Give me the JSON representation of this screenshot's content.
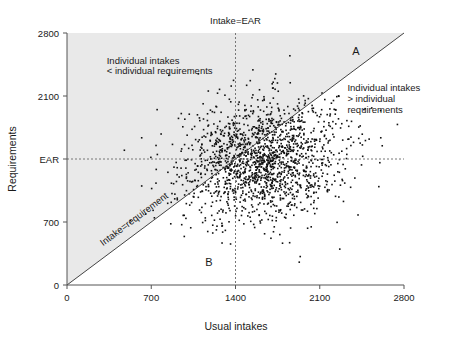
{
  "chart_data": {
    "type": "scatter",
    "title": "",
    "xlabel": "Usual intakes",
    "ylabel": "Requirements",
    "xlim": [
      0,
      2800
    ],
    "ylim": [
      0,
      2800
    ],
    "xticks": [
      0,
      700,
      1400,
      2100,
      2800
    ],
    "xticklabels": [
      "0",
      "700",
      "1400",
      "2100",
      "2800"
    ],
    "yticks": [
      0,
      700,
      1400,
      2100,
      2800
    ],
    "yticklabels": [
      "0",
      "700",
      "EAR",
      "2100",
      "2800"
    ],
    "grid": false,
    "legend": "none",
    "reference_lines": [
      {
        "name": "identity-line",
        "label": "Intake=requirement",
        "type": "diagonal",
        "from": [
          0,
          0
        ],
        "to": [
          2800,
          2800
        ],
        "style": "solid"
      },
      {
        "name": "ear-vertical",
        "label": "Intake=EAR",
        "type": "vertical",
        "x": 1400,
        "style": "dashed"
      },
      {
        "name": "ear-horizontal",
        "label": "EAR",
        "type": "horizontal",
        "y": 1400,
        "style": "dashed"
      }
    ],
    "shaded_region": {
      "name": "above-identity",
      "description": "Region above the intake=requirement line",
      "color": "#e9e9e9"
    },
    "annotations": [
      {
        "name": "upper-left-note",
        "text": "Individual intakes\n< individual requirements",
        "x": 430,
        "y": 2520
      },
      {
        "name": "right-note",
        "text": "Individual intakes\n> individual\nrequirements",
        "x": 2500,
        "y": 2150
      },
      {
        "name": "identity-line-label",
        "text": "Intake=requirement",
        "x": 430,
        "y": 430
      },
      {
        "name": "top-dashed-label",
        "text": "Intake=EAR",
        "x": 1400,
        "y": 2960
      },
      {
        "name": "region-a",
        "text": "A",
        "x": 2420,
        "y": 2620
      },
      {
        "name": "region-b",
        "text": "B",
        "x": 1180,
        "y": 200
      }
    ],
    "series": [
      {
        "name": "individuals",
        "description": "Usual intake vs individual requirement for each person",
        "n_points": 1700,
        "marker": "square",
        "marker_size_px": 1.6,
        "color": "#111111",
        "distribution": {
          "x_mean": 1620,
          "x_sd": 330,
          "y_mean": 1390,
          "y_sd": 330,
          "correlation": 0.15
        }
      }
    ]
  },
  "labels": {
    "tick_0": "0",
    "tick_700": "700",
    "tick_1400": "1400",
    "tick_2100": "2100",
    "tick_2800": "2800",
    "ear": "EAR",
    "x_axis_title": "Usual intakes",
    "y_axis_title": "Requirements",
    "note_upper_left_line1": "Individual intakes",
    "note_upper_left_line2": "< individual requirements",
    "note_right_line1": "Individual intakes",
    "note_right_line2": "> individual",
    "note_right_line3": "requirements",
    "diagonal_label": "Intake=requirement",
    "top_label": "Intake=EAR",
    "region_a": "A",
    "region_b": "B"
  },
  "colors": {
    "shaded_region": "#e9e9e9",
    "point": "#111111",
    "axis": "#555555",
    "dashed": "#777777",
    "diagonal": "#444444",
    "text": "#1a1a1a",
    "background": "#ffffff"
  }
}
